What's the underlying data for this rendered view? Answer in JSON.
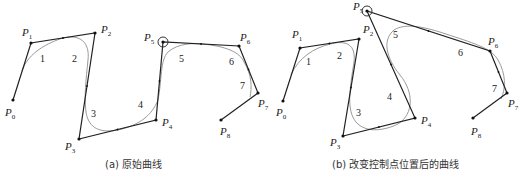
{
  "figures": [
    {
      "id": "a",
      "caption": "(a) 原始曲线",
      "selected_point": 5,
      "points": [
        {
          "label": "P",
          "sub": "0",
          "x": 13,
          "y": 100,
          "lx": 5,
          "ly": 116
        },
        {
          "label": "P",
          "sub": "1",
          "x": 31,
          "y": 43,
          "lx": 22,
          "ly": 36
        },
        {
          "label": "P",
          "sub": "2",
          "x": 95,
          "y": 33,
          "lx": 101,
          "ly": 33
        },
        {
          "label": "P",
          "sub": "3",
          "x": 79,
          "y": 139,
          "lx": 65,
          "ly": 150
        },
        {
          "label": "P",
          "sub": "4",
          "x": 156,
          "y": 120,
          "lx": 162,
          "ly": 126
        },
        {
          "label": "P",
          "sub": "5",
          "x": 163,
          "y": 42,
          "lx": 144,
          "ly": 41
        },
        {
          "label": "P",
          "sub": "6",
          "x": 239,
          "y": 46,
          "lx": 240,
          "ly": 41
        },
        {
          "label": "P",
          "sub": "7",
          "x": 258,
          "y": 93,
          "lx": 258,
          "ly": 107
        },
        {
          "label": "P",
          "sub": "8",
          "x": 221,
          "y": 120,
          "lx": 220,
          "ly": 135
        }
      ],
      "segments": [
        {
          "n": "1",
          "x": 40,
          "y": 62
        },
        {
          "n": "2",
          "x": 72,
          "y": 62
        },
        {
          "n": "3",
          "x": 91,
          "y": 117
        },
        {
          "n": "4",
          "x": 138,
          "y": 108
        },
        {
          "n": "5",
          "x": 179,
          "y": 62
        },
        {
          "n": "6",
          "x": 229,
          "y": 65
        },
        {
          "n": "7",
          "x": 240,
          "y": 89
        }
      ],
      "curve_path": "M 22 71 C 28 52, 50 42, 63 38 C 80 34, 90 42, 88 60 C 86 80, 84 96, 86 112 C 88 125, 96 134, 118 130 C 140 125, 152 115, 158 100 C 162 80, 160 60, 168 52 C 178 43, 195 43, 202 44 C 225 46, 240 52, 244 62 C 252 75, 252 88, 250 97"
    },
    {
      "id": "b",
      "caption": "(b) 改变控制点位置后的曲线",
      "selected_point": 5,
      "points": [
        {
          "label": "P",
          "sub": "0",
          "x": 283,
          "y": 101,
          "lx": 276,
          "ly": 116
        },
        {
          "label": "P",
          "sub": "1",
          "x": 300,
          "y": 48,
          "lx": 292,
          "ly": 38
        },
        {
          "label": "P",
          "sub": "2",
          "x": 359,
          "y": 39,
          "lx": 363,
          "ly": 33
        },
        {
          "label": "P",
          "sub": "3",
          "x": 343,
          "y": 136,
          "lx": 330,
          "ly": 146
        },
        {
          "label": "P",
          "sub": "4",
          "x": 415,
          "y": 118,
          "lx": 421,
          "ly": 124
        },
        {
          "label": "P",
          "sub": "5",
          "x": 367,
          "y": 11,
          "lx": 353,
          "ly": 10
        },
        {
          "label": "P",
          "sub": "6",
          "x": 490,
          "y": 51,
          "lx": 488,
          "ly": 45
        },
        {
          "label": "P",
          "sub": "7",
          "x": 507,
          "y": 93,
          "lx": 508,
          "ly": 107
        },
        {
          "label": "P",
          "sub": "8",
          "x": 473,
          "y": 118,
          "lx": 471,
          "ly": 135
        }
      ],
      "segments": [
        {
          "n": "1",
          "x": 306,
          "y": 65
        },
        {
          "n": "2",
          "x": 337,
          "y": 59
        },
        {
          "n": "3",
          "x": 356,
          "y": 116
        },
        {
          "n": "4",
          "x": 387,
          "y": 100
        },
        {
          "n": "5",
          "x": 393,
          "y": 38
        },
        {
          "n": "6",
          "x": 458,
          "y": 56
        },
        {
          "n": "7",
          "x": 492,
          "y": 92
        }
      ],
      "curve_path": "M 291 75 C 298 58, 314 48, 330 44 C 346 40, 356 44, 354 62 C 350 88, 346 110, 356 122 C 366 134, 386 130, 398 124 C 414 114, 414 92, 400 75 C 386 58, 382 40, 394 30 C 406 22, 428 28, 446 34 C 470 42, 492 48, 498 60 C 506 74, 506 88, 501 99"
    }
  ]
}
